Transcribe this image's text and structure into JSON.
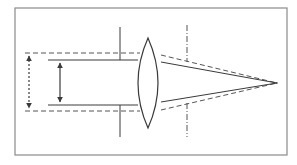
{
  "diagram": {
    "title": "",
    "colors": {
      "background": "#ffffff",
      "frame": "#8a8a8a",
      "stroke": "#3a3a3a",
      "dashed": "#555555"
    },
    "frame": {
      "x": 15,
      "y": 8,
      "width": 272,
      "height": 147
    },
    "lens": {
      "center_x": 148,
      "top_y": 38,
      "bottom_y": 128,
      "half_width": 13
    },
    "beam_solid": {
      "upper_y": 60,
      "lower_y": 105,
      "start_x": 48,
      "lens_x": 139
    },
    "beam_dashed": {
      "upper_y": 53,
      "lower_y": 111,
      "start_x": 25,
      "lens_x": 139
    },
    "focal_point": {
      "x": 277,
      "y": 83
    },
    "arrows": [
      {
        "name": "aperture-arrow",
        "style": "dotted",
        "x": 29,
        "y1": 53,
        "y2": 111
      },
      {
        "name": "beam-arrow",
        "style": "solid",
        "x": 60,
        "y1": 60,
        "y2": 105
      }
    ],
    "vertical_markers": [
      {
        "name": "left-stop-marker",
        "style": "solid",
        "x": 120,
        "segments": [
          [
            27,
            60
          ],
          [
            105,
            137
          ]
        ]
      },
      {
        "name": "right-stop-marker",
        "style": "dashdot",
        "x": 187,
        "segments": [
          [
            25,
            62
          ],
          [
            103,
            137
          ]
        ]
      }
    ],
    "labels": []
  }
}
